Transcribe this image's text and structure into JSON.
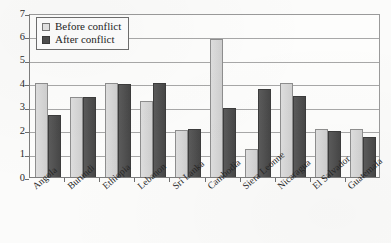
{
  "chart_data": {
    "type": "bar",
    "title": "",
    "subtitle": "",
    "xlabel": "",
    "ylabel": "",
    "ylim": [
      0,
      7
    ],
    "yticks": [
      0,
      1,
      2,
      3,
      4,
      5,
      6,
      7
    ],
    "ytick_labels": [
      "0",
      "1",
      "2",
      "3",
      "4",
      "5",
      "6",
      "7"
    ],
    "grid": true,
    "legend_position": "top-left",
    "categories": [
      "Angola",
      "Burundi",
      "Ethiopia",
      "Lebanon",
      "Sri Lanka",
      "Cambodia",
      "Siera Leonne",
      "Nicaragua",
      "El Salvador",
      "Guatemala"
    ],
    "series": [
      {
        "name": "Before conflict",
        "color": "#d8d8d8",
        "values": [
          4.0,
          3.4,
          4.0,
          3.25,
          2.0,
          5.9,
          1.2,
          4.0,
          2.05,
          2.05
        ]
      },
      {
        "name": "After conflict",
        "color": "#4e4e4e",
        "values": [
          2.65,
          3.4,
          3.95,
          4.0,
          2.05,
          2.95,
          3.75,
          3.45,
          1.95,
          1.7
        ]
      }
    ]
  },
  "legend": {
    "items": [
      {
        "label": "Before conflict"
      },
      {
        "label": "After conflict"
      }
    ]
  }
}
